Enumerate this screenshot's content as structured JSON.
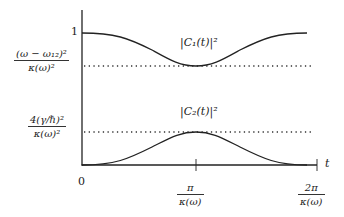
{
  "diagram": {
    "type": "time evolution of two-level populations",
    "y_axis": {
      "tick_labels": [
        {
          "id": "one",
          "text": "1"
        },
        {
          "id": "c1_min",
          "numerator": "(ω − ω₁₂)²",
          "denominator": "κ(ω)²"
        },
        {
          "id": "c2_max",
          "numerator": "4(γ/ℏ)²",
          "denominator": "κ(ω)²"
        }
      ]
    },
    "x_axis": {
      "label": "t",
      "tick_labels": [
        {
          "id": "zero",
          "text": "0"
        },
        {
          "id": "half",
          "numerator": "π",
          "denominator": "κ(ω)"
        },
        {
          "id": "full",
          "numerator": "2π",
          "denominator": "κ(ω)"
        }
      ]
    },
    "curves": [
      {
        "name": "|C₁(t)|²",
        "start": 1,
        "min_level": "(ω − ω₁₂)²/κ(ω)²"
      },
      {
        "name": "|C₂(t)|²",
        "start": 0,
        "max_level": "4(γ/ℏ)²/κ(ω)²"
      }
    ],
    "reference_lines": [
      "dotted line at (ω − ω₁₂)²/κ(ω)²",
      "dotted line at 4(γ/ℏ)²/κ(ω)²"
    ]
  },
  "labels": {
    "c1_curve": "|C₁(t)|²",
    "c2_curve": "|C₂(t)|²",
    "y_one": "1",
    "y_c1_num": "(ω − ω₁₂)²",
    "y_c1_den": "κ(ω)²",
    "y_c2_num": "4(γ/ℏ)²",
    "y_c2_den": "κ(ω)²",
    "x_zero": "0",
    "x_half_num": "π",
    "x_half_den": "κ(ω)",
    "x_full_num": "2π",
    "x_full_den": "κ(ω)",
    "x_axis_label": "t"
  }
}
